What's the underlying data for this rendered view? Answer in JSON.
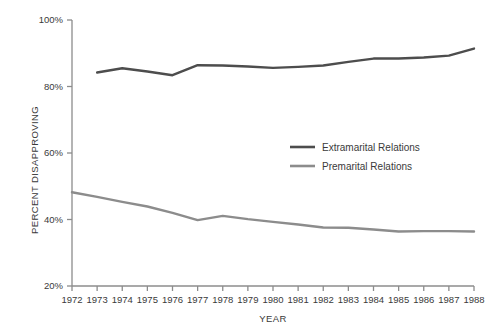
{
  "chart_data": {
    "type": "line",
    "title": "",
    "xlabel": "YEAR",
    "ylabel": "PERCENT DISAPPROVING",
    "grid": false,
    "legend_position": "center-right",
    "xlim": [
      1972,
      1988
    ],
    "ylim": [
      20,
      100
    ],
    "x": [
      1972,
      1973,
      1974,
      1975,
      1976,
      1977,
      1978,
      1979,
      1980,
      1981,
      1982,
      1983,
      1984,
      1985,
      1986,
      1987,
      1988
    ],
    "categories": [
      "1972",
      "1973",
      "1974",
      "1975",
      "1976",
      "1977",
      "1978",
      "1979",
      "1980",
      "1981",
      "1982",
      "1983",
      "1984",
      "1985",
      "1986",
      "1987",
      "1988"
    ],
    "ytick_labels": [
      "100%",
      "80%",
      "60%",
      "40%",
      "20%"
    ],
    "ytick_values": [
      100,
      80,
      60,
      40,
      20
    ],
    "series": [
      {
        "name": "Extramarital Relations",
        "color": "#4d4d4d",
        "x": [
          1973,
          1974,
          1975,
          1976,
          1977,
          1978,
          1979,
          1980,
          1981,
          1982,
          1983,
          1984,
          1985,
          1986,
          1987,
          1988
        ],
        "values": [
          84.2,
          85.5,
          84.5,
          83.4,
          86.4,
          86.3,
          86.0,
          85.6,
          85.9,
          86.3,
          87.4,
          88.4,
          88.4,
          88.7,
          89.3,
          91.4
        ]
      },
      {
        "name": "Premarital Relations",
        "color": "#8c8c8c",
        "x": [
          1972,
          1973,
          1974,
          1975,
          1976,
          1977,
          1978,
          1979,
          1980,
          1981,
          1982,
          1983,
          1984,
          1985,
          1986,
          1987,
          1988
        ],
        "values": [
          48.2,
          46.8,
          45.3,
          43.9,
          42.0,
          39.8,
          41.1,
          40.1,
          39.3,
          38.5,
          37.6,
          37.5,
          37.0,
          36.4,
          36.5,
          36.5,
          36.4
        ]
      }
    ]
  },
  "legend": {
    "items": [
      {
        "label": "Extramarital Relations",
        "color": "#4d4d4d"
      },
      {
        "label": "Premarital Relations",
        "color": "#8c8c8c"
      }
    ]
  },
  "axes": {
    "y_title": "PERCENT DISAPPROVING",
    "x_title": "YEAR",
    "axis_color": "#8c8c8c"
  }
}
